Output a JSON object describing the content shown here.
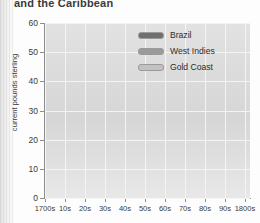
{
  "title": "and the Caribbean",
  "chart_data": {
    "type": "line",
    "title": "and the Caribbean",
    "xlabel": "",
    "ylabel": "current pounds sterling",
    "categories": [
      "1700s",
      "10s",
      "20s",
      "30s",
      "40s",
      "50s",
      "60s",
      "70s",
      "80s",
      "90s",
      "1800s"
    ],
    "ylim": [
      0,
      60
    ],
    "yticks": [
      0,
      10,
      20,
      30,
      40,
      50,
      60
    ],
    "grid": true,
    "legend_position": "top-right",
    "series": [
      {
        "name": "Brazil",
        "color": "#6f6f6f",
        "values": [
          24,
          40,
          40,
          40,
          31,
          24,
          18,
          15,
          25,
          22,
          29
        ]
      },
      {
        "name": "West Indies",
        "color": "#9a9a9a",
        "values": [
          24,
          22,
          22,
          22,
          23,
          29,
          34,
          41,
          46,
          53,
          53
        ]
      },
      {
        "name": "Gold Coast",
        "color": "#c2c2c2",
        "values": [
          11,
          15,
          16,
          14,
          17,
          18,
          18,
          13,
          25,
          22,
          19
        ]
      }
    ]
  },
  "legend": {
    "items": [
      {
        "label": "Brazil",
        "color": "#6f6f6f"
      },
      {
        "label": "West Indies",
        "color": "#9a9a9a"
      },
      {
        "label": "Gold Coast",
        "color": "#c2c2c2"
      }
    ]
  }
}
